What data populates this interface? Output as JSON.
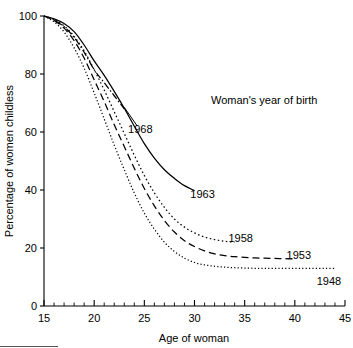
{
  "chart_data": {
    "type": "line",
    "title": "",
    "xlabel": "Age of woman",
    "ylabel": "Percentage of women childless",
    "annotation": "Woman's year of birth",
    "xlim": [
      15,
      45
    ],
    "ylim": [
      0,
      100
    ],
    "grid": false,
    "legend_position": "inline-end-labels",
    "x_ticks": [
      15,
      20,
      25,
      30,
      35,
      40,
      45
    ],
    "x_minor_tick_step": 1,
    "y_ticks": [
      0,
      20,
      40,
      60,
      80,
      100
    ],
    "x_tick_labels": [
      "15",
      "20",
      "25",
      "30",
      "35",
      "40",
      "45"
    ],
    "y_tick_labels": [
      "0",
      "20",
      "40",
      "60",
      "80",
      "100"
    ],
    "series": [
      {
        "name": "1968",
        "label": "1968",
        "line_style": "dashdot",
        "color": "#000000",
        "label_x": 24.6,
        "label_y": 61,
        "leader_from_x": 23.0,
        "leader_from_y": 68.5,
        "x": [
          15,
          16,
          17,
          18,
          19,
          20,
          21,
          22,
          23
        ],
        "y": [
          100,
          98.6,
          96.3,
          92.6,
          87.5,
          81.5,
          77.0,
          72.5,
          68.0
        ]
      },
      {
        "name": "1963",
        "label": "1963",
        "line_style": "solid",
        "color": "#000000",
        "label_x": 30.8,
        "label_y": 38.5,
        "x": [
          15,
          16,
          17,
          18,
          19,
          20,
          21,
          22,
          23,
          24,
          25,
          26,
          27,
          28,
          29,
          30
        ],
        "y": [
          100,
          99.0,
          97.4,
          94.6,
          90.0,
          84.5,
          79.5,
          74.0,
          68.2,
          62.0,
          56.0,
          51.0,
          47.0,
          44.0,
          41.5,
          39.8
        ]
      },
      {
        "name": "1958",
        "label": "1958",
        "line_style": "dotted",
        "color": "#000000",
        "label_x": 34.6,
        "label_y": 23.5,
        "x": [
          15,
          16,
          17,
          18,
          19,
          20,
          21,
          22,
          23,
          24,
          25,
          26,
          27,
          28,
          29,
          30,
          31,
          32,
          33,
          34
        ],
        "y": [
          100,
          98.8,
          96.6,
          93.0,
          88.0,
          81.5,
          74.5,
          67.0,
          59.5,
          52.0,
          45.0,
          39.0,
          34.0,
          30.0,
          27.2,
          25.2,
          23.8,
          22.9,
          22.3,
          22.0
        ]
      },
      {
        "name": "1953",
        "label": "1953",
        "line_style": "dashed",
        "color": "#000000",
        "label_x": 40.4,
        "label_y": 17.5,
        "x": [
          15,
          16,
          17,
          18,
          19,
          20,
          21,
          22,
          23,
          24,
          25,
          26,
          27,
          28,
          29,
          30,
          31,
          32,
          33,
          34,
          35,
          36,
          37,
          38,
          39,
          40
        ],
        "y": [
          100,
          98.5,
          95.8,
          91.5,
          85.5,
          78.0,
          70.5,
          62.5,
          55.0,
          47.5,
          40.5,
          34.5,
          29.5,
          25.5,
          22.5,
          20.5,
          19.0,
          18.0,
          17.4,
          17.0,
          16.8,
          16.6,
          16.5,
          16.4,
          16.3,
          16.2
        ]
      },
      {
        "name": "1948",
        "label": "1948",
        "line_style": "fine-dotted",
        "color": "#000000",
        "label_x": 43.4,
        "label_y": 8.5,
        "x": [
          15,
          16,
          17,
          18,
          19,
          20,
          21,
          22,
          23,
          24,
          25,
          26,
          27,
          28,
          29,
          30,
          31,
          32,
          33,
          34,
          35,
          36,
          37,
          38,
          39,
          40,
          41,
          42,
          43,
          44
        ],
        "y": [
          100,
          98.0,
          94.5,
          89.0,
          82.0,
          73.5,
          64.5,
          55.5,
          47.0,
          39.0,
          32.0,
          26.5,
          22.0,
          18.8,
          16.5,
          15.0,
          14.2,
          13.7,
          13.4,
          13.2,
          13.1,
          13.0,
          13.0,
          13.0,
          13.0,
          13.0,
          13.0,
          13.0,
          13.0,
          13.0
        ]
      }
    ]
  }
}
